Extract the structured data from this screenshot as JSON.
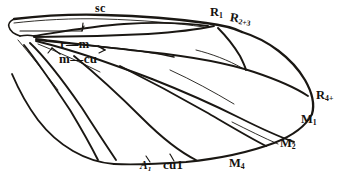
{
  "figure": {
    "kind": "insect-wing-venation-diagram",
    "background_color": "#ffffff",
    "ink_color": "#1a1713"
  },
  "labels": {
    "subcosta": {
      "text": "sc",
      "vein": "Sc",
      "position": "anterior-margin-basal"
    },
    "radius_1": {
      "text": "R",
      "sub": "1",
      "position": "wing-apex-anterior"
    },
    "radius_2_3": {
      "text": "R",
      "sub": "2+3",
      "position": "wing-apex-anterior"
    },
    "radius_4_5": {
      "text": "R",
      "sub": "4+",
      "position": "wing-apex-posterior"
    },
    "crossvein_r_m": {
      "text": "r—m",
      "position": "discal-cell-anterior"
    },
    "crossvein_m_cu": {
      "text": "m—cu",
      "position": "discal-cell-posterior"
    },
    "media_1": {
      "text": "M",
      "sub": "1",
      "position": "posterior-margin"
    },
    "media_2": {
      "text": "M",
      "sub": "2",
      "position": "posterior-margin"
    },
    "media_4": {
      "text": "M",
      "sub": "4",
      "position": "posterior-margin"
    },
    "anal_1": {
      "text": "A",
      "sub": "1",
      "position": "basal-posterior-margin"
    },
    "cubitus_1": {
      "text": "cu1",
      "position": "basal-posterior-margin"
    }
  }
}
